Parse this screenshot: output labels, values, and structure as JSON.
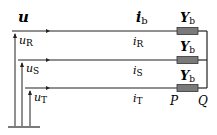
{
  "diagram": {
    "top_labels": {
      "voltage": "u",
      "current": "i",
      "current_sub": "b",
      "admittance": "Y",
      "admittance_sub": "b"
    },
    "phases": [
      {
        "voltage_label": "u",
        "voltage_sub": "R",
        "current_label": "i",
        "current_sub": "R",
        "admittance": "Y",
        "admittance_sub": "b"
      },
      {
        "voltage_label": "u",
        "voltage_sub": "S",
        "current_label": "i",
        "current_sub": "S",
        "admittance": "Y",
        "admittance_sub": "b"
      },
      {
        "voltage_label": "u",
        "voltage_sub": "T",
        "current_label": "i",
        "current_sub": "T",
        "admittance": "Y",
        "admittance_sub": "b"
      }
    ],
    "nodes": {
      "p": "P",
      "q": "Q"
    },
    "colors": {
      "line": "#222222",
      "resistor_fill": "#7a7a7a",
      "resistor_stroke": "#333333"
    }
  }
}
